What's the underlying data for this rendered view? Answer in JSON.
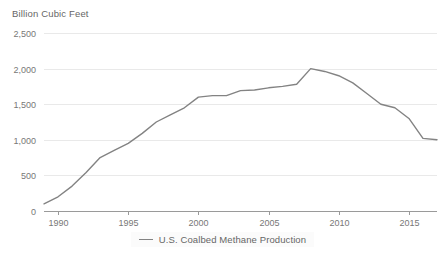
{
  "chart_data": {
    "type": "line",
    "title": "",
    "ylabel": "Billion Cubic Feet",
    "xlabel": "",
    "ylim": [
      0,
      2500
    ],
    "xlim": [
      1989,
      2017
    ],
    "grid": true,
    "legend_position": "bottom",
    "y_ticks": [
      0,
      500,
      1000,
      1500,
      2000,
      2500
    ],
    "y_tick_labels": [
      "0",
      "500",
      "1,000",
      "1,500",
      "2,000",
      "2,500"
    ],
    "x_ticks": [
      1990,
      1995,
      2000,
      2005,
      2010,
      2015
    ],
    "x_tick_labels": [
      "1990",
      "1995",
      "2000",
      "2005",
      "2010",
      "2015"
    ],
    "series": [
      {
        "name": "U.S. Coalbed Methane Production",
        "color": "#838383",
        "x": [
          1989,
          1990,
          1991,
          1992,
          1993,
          1994,
          1995,
          1996,
          1997,
          1998,
          1999,
          2000,
          2001,
          2002,
          2003,
          2004,
          2005,
          2006,
          2007,
          2008,
          2009,
          2010,
          2011,
          2012,
          2013,
          2014,
          2015,
          2016,
          2017
        ],
        "values": [
          100,
          200,
          350,
          540,
          750,
          850,
          950,
          1090,
          1250,
          1350,
          1450,
          1600,
          1620,
          1620,
          1690,
          1700,
          1730,
          1750,
          1780,
          2000,
          1960,
          1900,
          1800,
          1650,
          1500,
          1450,
          1300,
          1020,
          1000
        ]
      }
    ]
  },
  "legend": {
    "label": "U.S. Coalbed Methane Production"
  }
}
